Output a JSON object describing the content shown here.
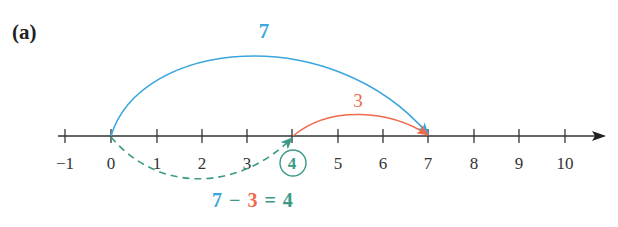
{
  "panel_label": "(a)",
  "number_line": {
    "ticks": [
      "-1",
      "0",
      "1",
      "2",
      "3",
      "4",
      "5",
      "6",
      "7",
      "8",
      "9",
      "10"
    ],
    "tick_x": [
      65,
      111,
      157,
      202,
      247,
      292,
      338,
      383,
      428,
      474,
      519,
      565
    ],
    "axis_y": 136
  },
  "jumps": {
    "forward": {
      "label": "7",
      "from": 0,
      "to": 7,
      "color": "#3aa6dd"
    },
    "back": {
      "label": "3",
      "from": 4,
      "to": 7,
      "color": "#ef6a4c"
    },
    "result": {
      "from": 0,
      "to": 4,
      "color": "#3a9a86",
      "style": "dashed"
    }
  },
  "equation": {
    "a": "7",
    "op1": "−",
    "b": "3",
    "op2": "=",
    "c": "4"
  },
  "colors": {
    "blue": "#3aa6dd",
    "red": "#ef6a4c",
    "teal": "#3a9a86",
    "axis": "#333333"
  }
}
